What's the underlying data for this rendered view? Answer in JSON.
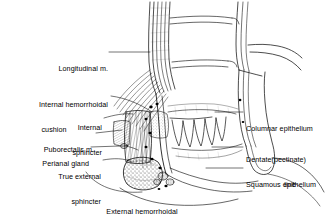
{
  "figure": {
    "kind": "anatomical-line-diagram",
    "background_color": "#ffffff",
    "ink_color": "#000000",
    "width": 334,
    "height": 215
  },
  "labels": {
    "longitudinal_m": {
      "text": "Longitudinal m.",
      "side": "left",
      "lines": [
        "Longitudinal m."
      ]
    },
    "internal_hemorrhoidal_cushion": {
      "text": "Internal hemorrhoidal cushion",
      "side": "left",
      "lines": [
        "Internal hemorrhoidal",
        "cushion"
      ]
    },
    "internal_sphincter": {
      "text": "Internal sphincter",
      "side": "left",
      "lines": [
        "Internal",
        "sphincter"
      ]
    },
    "puborectalis_m": {
      "text": "Puborectalis m.",
      "side": "left",
      "lines": [
        "Puborectalis m."
      ]
    },
    "perianal_gland": {
      "text": "Perianal gland",
      "side": "left",
      "lines": [
        "Perianal gland"
      ]
    },
    "true_external_sphincter": {
      "text": "True external sphincter",
      "side": "left",
      "lines": [
        "True external",
        "sphincter"
      ]
    },
    "columnar_epithelium": {
      "text": "Columnar epithelium",
      "side": "right",
      "lines": [
        "Columnar epithelium"
      ]
    },
    "dentate_pectinate_line": {
      "text": "Dentate(pectinate) line",
      "side": "right",
      "lines": [
        "Dentate(pectinate)",
        "line"
      ]
    },
    "squamous_epithelium": {
      "text": "Squamous epithelium",
      "side": "right",
      "lines": [
        "Squamous epithelium"
      ]
    },
    "external_hemorrhoidal_cushion": {
      "text": "External hemorrhoidal cushion",
      "side": "bottom",
      "lines": [
        "External hemorrhoidal",
        "cushion"
      ]
    }
  }
}
